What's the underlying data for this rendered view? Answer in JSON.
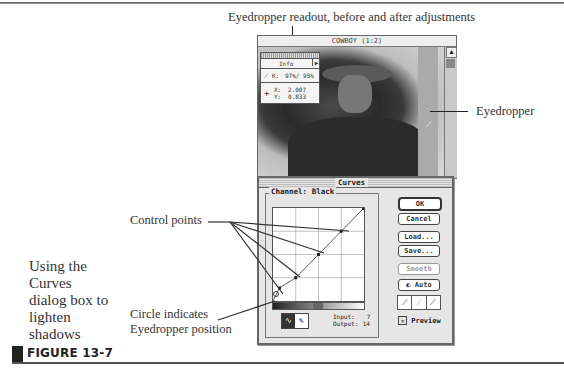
{
  "callouts": {
    "readout": "Eyedropper readout, before and after adjustments",
    "eyedropper": "Eyedropper",
    "control_points": "Control points",
    "circle_line1": "Circle indicates",
    "circle_line2": "Eyedropper position"
  },
  "caption": {
    "text": "Using the Curves dialog box to lighten shadows"
  },
  "figure": {
    "label": "FIGURE 13-7"
  },
  "image_window": {
    "title": "COWBOY (1:2)",
    "info_palette": {
      "title": "Info",
      "k_label": "K:",
      "k_value": "97%/ 95%",
      "x_label": "X:",
      "x_value": "2.007",
      "y_label": "Y:",
      "y_value": "0.833"
    }
  },
  "curves_dialog": {
    "title": "Curves",
    "channel_label": "Channel: Black",
    "buttons": {
      "ok": "OK",
      "cancel": "Cancel",
      "load": "Load...",
      "save": "Save...",
      "smooth": "Smooth",
      "auto": "Auto"
    },
    "input_label": "Input:",
    "input_value": "7",
    "output_label": "Output:",
    "output_value": "14",
    "preview_label": "Preview",
    "preview_checked": true,
    "control_points": [
      [
        0.07,
        0.14
      ],
      [
        0.25,
        0.25
      ],
      [
        0.5,
        0.5
      ],
      [
        0.75,
        0.75
      ]
    ]
  }
}
